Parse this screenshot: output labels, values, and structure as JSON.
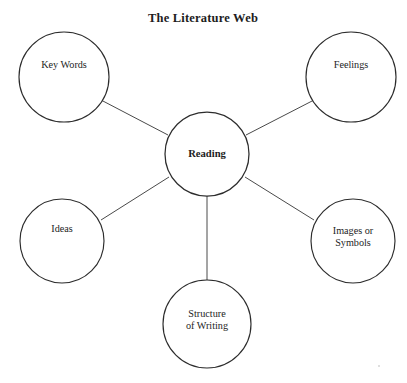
{
  "figure": {
    "title": "The Literature Web",
    "type": "concept-web-diagram",
    "background_color": "#ffffff",
    "stroke_color": "#2c2c2c",
    "connector_color": "#4a4a4a",
    "text_color": "#1d1d1d"
  },
  "center_node": {
    "id": "reading",
    "label": "Reading",
    "cx": 207,
    "cy": 154,
    "r": 42,
    "bold": true
  },
  "nodes": [
    {
      "id": "key-words",
      "label": "Key Words",
      "lines": [
        "Key Words"
      ],
      "cx": 64,
      "cy": 77,
      "r": 45
    },
    {
      "id": "feelings",
      "label": "Feelings",
      "lines": [
        "Feelings"
      ],
      "cx": 351,
      "cy": 77,
      "r": 45
    },
    {
      "id": "ideas",
      "label": "Ideas",
      "lines": [
        "Ideas"
      ],
      "cx": 62,
      "cy": 241,
      "r": 42
    },
    {
      "id": "images-or-symbols",
      "label": "Images or Symbols",
      "lines": [
        "Images or",
        "Symbols"
      ],
      "cx": 353,
      "cy": 241,
      "r": 42
    },
    {
      "id": "structure-of-writing",
      "label": "Structure of Writing",
      "lines": [
        "Structure",
        "of Writing"
      ],
      "cx": 207,
      "cy": 324,
      "r": 44
    }
  ],
  "connectors": [
    {
      "id": "reading-to-key-words",
      "from": "reading",
      "to": "key-words",
      "x1": 168,
      "y1": 135,
      "x2": 101,
      "y2": 100
    },
    {
      "id": "reading-to-feelings",
      "from": "reading",
      "to": "feelings",
      "x1": 246,
      "y1": 135,
      "x2": 314,
      "y2": 100
    },
    {
      "id": "reading-to-ideas",
      "from": "reading",
      "to": "ideas",
      "x1": 169,
      "y1": 177,
      "x2": 101,
      "y2": 220
    },
    {
      "id": "reading-to-images-or-symbols",
      "from": "reading",
      "to": "images-or-symbols",
      "x1": 245,
      "y1": 177,
      "x2": 314,
      "y2": 220
    },
    {
      "id": "reading-to-structure-of-writing",
      "from": "reading",
      "to": "structure-of-writing",
      "x1": 207,
      "y1": 196,
      "x2": 207,
      "y2": 281
    }
  ]
}
